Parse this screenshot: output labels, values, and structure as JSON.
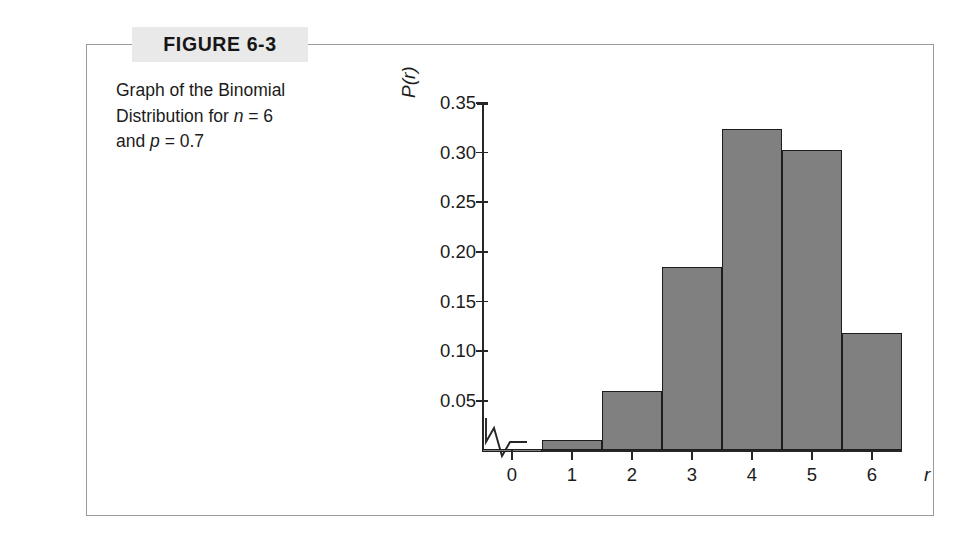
{
  "figure": {
    "label": "FIGURE 6-3",
    "caption_line1_pre": "Graph of the Binomial",
    "caption_line2_pre": "Distribution for ",
    "caption_n_symbol": "n",
    "caption_n_value": " = 6",
    "caption_line3_pre": "and ",
    "caption_p_symbol": "p",
    "caption_p_value": " = 0.7",
    "label_band_color": "#e9e9e9",
    "frame_color": "#9a9a9a"
  },
  "chart_data": {
    "type": "bar",
    "title": "Graph of the Binomial Distribution for n = 6 and p = 0.7",
    "xlabel": "r",
    "ylabel": "P(r)",
    "categories": [
      "0",
      "1",
      "2",
      "3",
      "4",
      "5",
      "6"
    ],
    "values": [
      0.001,
      0.01,
      0.06,
      0.185,
      0.324,
      0.303,
      0.118
    ],
    "ylim": [
      0,
      0.35
    ],
    "xlim": [
      -0.5,
      6.5
    ],
    "ytick_labels": [
      "0.35",
      "0.30",
      "0.25",
      "0.20",
      "0.15",
      "0.10",
      "0.05"
    ],
    "ytick_values": [
      0.35,
      0.3,
      0.25,
      0.2,
      0.15,
      0.1,
      0.05
    ],
    "grid": false,
    "legend": "none",
    "bar_fill_color": "#808080",
    "bar_border_color": "#1d1d1d",
    "axis_color": "#262626",
    "axis_break": true,
    "parameters": {
      "n": 6,
      "p": 0.7
    }
  }
}
